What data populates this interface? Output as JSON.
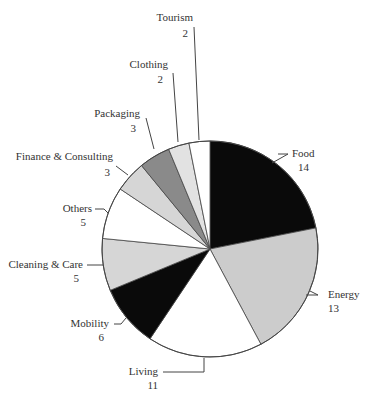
{
  "chart_data": {
    "type": "pie",
    "title": "",
    "start_angle_deg": 0,
    "direction": "clockwise",
    "total": 64,
    "slices": [
      {
        "label": "Food",
        "value": 14,
        "color": "#0a0a0a"
      },
      {
        "label": "Energy",
        "value": 13,
        "color": "#cccccc"
      },
      {
        "label": "Living",
        "value": 11,
        "color": "#ffffff"
      },
      {
        "label": "Mobility",
        "value": 6,
        "color": "#0a0a0a"
      },
      {
        "label": "Cleaning & Care",
        "value": 5,
        "color": "#d6d6d6"
      },
      {
        "label": "Others",
        "value": 5,
        "color": "#ffffff"
      },
      {
        "label": "Finance & Consulting",
        "value": 3,
        "color": "#d6d6d6"
      },
      {
        "label": "Packaging",
        "value": 3,
        "color": "#8a8a8a"
      },
      {
        "label": "Clothing",
        "value": 2,
        "color": "#e2e2e2"
      },
      {
        "label": "Tourism",
        "value": 2,
        "color": "#ffffff"
      }
    ],
    "legend": "none (direct labels with leader lines)",
    "grid": false
  },
  "labels": [
    {
      "name": "Food",
      "value": "14",
      "x": 292,
      "y": 157,
      "anchor": "start",
      "vx": 298,
      "vy": 171,
      "leader": [
        [
          278,
          154
        ],
        [
          288,
          154
        ]
      ],
      "from": [
        272,
        163
      ]
    },
    {
      "name": "Energy",
      "value": "13",
      "x": 328,
      "y": 298,
      "anchor": "start",
      "vx": 328,
      "vy": 312,
      "leader": [
        [
          306,
          295
        ],
        [
          318,
          295
        ]
      ],
      "from": [
        310,
        291
      ]
    },
    {
      "name": "Living",
      "value": "11",
      "x": 158,
      "y": 375,
      "anchor": "end",
      "vx": 158,
      "vy": 389,
      "leader": [
        [
          204,
          358
        ],
        [
          204,
          372
        ],
        [
          163,
          372
        ]
      ],
      "from": null
    },
    {
      "name": "Mobility",
      "value": "6",
      "x": 109,
      "y": 327,
      "anchor": "end",
      "vx": 104,
      "vy": 341,
      "leader": [
        [
          114,
          324
        ],
        [
          121,
          324
        ]
      ],
      "from": [
        126,
        318
      ]
    },
    {
      "name": "Cleaning & Care",
      "value": "5",
      "x": 83,
      "y": 268,
      "anchor": "end",
      "vx": 79,
      "vy": 282,
      "leader": [
        [
          87,
          265
        ],
        [
          103,
          265
        ]
      ],
      "from": null
    },
    {
      "name": "Others",
      "value": "5",
      "x": 92,
      "y": 212,
      "anchor": "end",
      "vx": 86,
      "vy": 226,
      "leader": [
        [
          95,
          209
        ],
        [
          104,
          209
        ]
      ],
      "from": [
        108,
        213
      ]
    },
    {
      "name": "Finance & Consulting",
      "value": "3",
      "x": 113,
      "y": 160,
      "anchor": "end",
      "vx": 110,
      "vy": 176,
      "leader": [
        [
          116,
          166
        ],
        [
          128,
          175
        ]
      ],
      "from": null
    },
    {
      "name": "Packaging",
      "value": "3",
      "x": 140,
      "y": 117,
      "anchor": "end",
      "vx": 136,
      "vy": 132,
      "leader": [
        [
          146,
          118
        ],
        [
          154,
          149
        ]
      ],
      "from": null
    },
    {
      "name": "Clothing",
      "value": "2",
      "x": 168,
      "y": 68,
      "anchor": "end",
      "vx": 163,
      "vy": 83,
      "leader": [
        [
          173,
          73
        ],
        [
          178,
          142
        ]
      ],
      "from": null
    },
    {
      "name": "Tourism",
      "value": "2",
      "x": 193,
      "y": 21,
      "anchor": "end",
      "vx": 188,
      "vy": 37,
      "leader": [
        [
          194,
          27
        ],
        [
          199,
          140
        ]
      ],
      "from": null
    }
  ],
  "geometry": {
    "cx": 210,
    "cy": 249,
    "r": 108
  }
}
